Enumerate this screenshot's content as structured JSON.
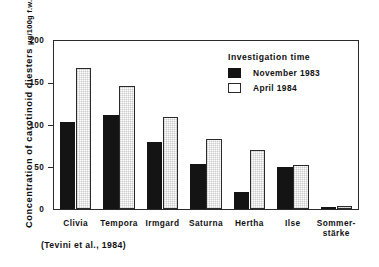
{
  "figure": {
    "citation": "(Tevini et al., 1984)",
    "y_axis_title": "Concentration of carotinoid diesters",
    "y_axis_unit": "µg/100g f.w."
  },
  "legend": {
    "title": "Investigation time",
    "entries": [
      {
        "label": "November 1983",
        "color": "#141414",
        "swatch": "nov"
      },
      {
        "label": "April 1984",
        "color": "#ffffff",
        "swatch": "apr"
      }
    ]
  },
  "chart_data": {
    "type": "bar",
    "title": "",
    "subtitle": "",
    "xlabel": "",
    "ylabel": "Concentration of carotinoid diesters  µg/100g f.w.",
    "ylim": [
      0,
      200
    ],
    "yticks": [
      0,
      50,
      100,
      150,
      200
    ],
    "ytick_labels": [
      "0",
      "50",
      "100",
      "150",
      "200"
    ],
    "grid": false,
    "legend_position": "top-right-inside",
    "categories": [
      "Clivia",
      "Tempora",
      "Irmgard",
      "Saturna",
      "Hertha",
      "Ilse",
      "Sommer-\nstärke"
    ],
    "category_labels": [
      {
        "line1": "Clivia",
        "line2": ""
      },
      {
        "line1": "Tempora",
        "line2": ""
      },
      {
        "line1": "Irmgard",
        "line2": ""
      },
      {
        "line1": "Saturna",
        "line2": ""
      },
      {
        "line1": "Hertha",
        "line2": ""
      },
      {
        "line1": "Ilse",
        "line2": ""
      },
      {
        "line1": "Sommer-",
        "line2": "stärke"
      }
    ],
    "series": [
      {
        "name": "November 1983",
        "color": "#141414",
        "values": [
          103,
          112,
          80,
          53,
          20,
          50,
          1
        ]
      },
      {
        "name": "April 1984",
        "color": "#ffffff",
        "values": [
          168,
          147,
          110,
          83,
          70,
          52,
          3
        ]
      }
    ],
    "annotations": [
      "(Tevini et al., 1984)"
    ]
  }
}
